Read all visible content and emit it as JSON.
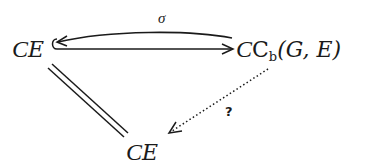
{
  "diagram": {
    "type": "commutative-diagram",
    "nodes": {
      "top_left": {
        "script": "C",
        "base": "E",
        "full": "𝒞E"
      },
      "top_right": {
        "script": "C",
        "roman": "C",
        "subscript": "b",
        "args": "(G, E)",
        "full": "𝒞C_b(G, E)"
      },
      "bottom": {
        "script": "C",
        "base": "E",
        "full": "𝒞E"
      }
    },
    "arrows": [
      {
        "id": "sigma",
        "from": "top_right",
        "to": "top_left",
        "label": "σ",
        "style": "curved-solid"
      },
      {
        "id": "inclusion",
        "from": "top_left",
        "to": "top_right",
        "label": "",
        "style": "hooked-solid"
      },
      {
        "id": "identity",
        "from": "top_left",
        "to": "bottom",
        "label": "",
        "style": "double-line"
      },
      {
        "id": "unknown",
        "from": "top_right",
        "to": "bottom",
        "label": "?",
        "style": "dotted"
      }
    ],
    "colors": {
      "ink": "#1a1a1a",
      "background": "#ffffff"
    }
  }
}
